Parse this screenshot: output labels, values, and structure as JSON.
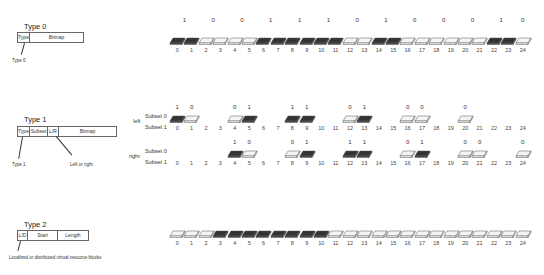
{
  "type0": {
    "title": "Type 0",
    "fields": [
      {
        "label": "Type",
        "w": 11
      },
      {
        "label": "Bitmap",
        "w": 53
      }
    ],
    "pointer_note": "Type 0",
    "bits": [
      "1",
      "0",
      "0",
      "1",
      "1",
      "1",
      "0",
      "1",
      "0",
      "0",
      "0",
      "1",
      "0"
    ],
    "dark_blocks": [
      0,
      1,
      6,
      7,
      8,
      9,
      10,
      11,
      14,
      15,
      22,
      23
    ],
    "indices": [
      "0",
      "1",
      "2",
      "3",
      "4",
      "5",
      "6",
      "7",
      "8",
      "9",
      "10",
      "11",
      "12",
      "13",
      "14",
      "15",
      "16",
      "17",
      "18",
      "19",
      "20",
      "21",
      "22",
      "23",
      "24"
    ]
  },
  "type1": {
    "title": "Type 1",
    "fields": [
      {
        "label": "Type",
        "w": 11
      },
      {
        "label": "Subset",
        "w": 17
      },
      {
        "label": "L/R",
        "w": 10
      },
      {
        "label": "Bitmap",
        "w": 57
      }
    ],
    "pointer_note_type": "Type 1",
    "pointer_note_lr": "Left or right",
    "left": {
      "label": "left",
      "subset0": "Subset 0",
      "subset1": "Subset 1",
      "groups": [
        {
          "start": 0,
          "bits": [
            "1",
            "0"
          ],
          "dark": [
            0
          ]
        },
        {
          "start": 4,
          "bits": [
            "0",
            "1"
          ],
          "dark": [
            5
          ]
        },
        {
          "start": 8,
          "bits": [
            "1",
            "1"
          ],
          "dark": [
            8,
            9
          ]
        },
        {
          "start": 12,
          "bits": [
            "0",
            "1"
          ],
          "dark": [
            13
          ]
        },
        {
          "start": 16,
          "bits": [
            "0",
            "0"
          ],
          "dark": []
        },
        {
          "start": 20,
          "bits": [
            "0"
          ],
          "dark": []
        }
      ]
    },
    "right": {
      "label": "right",
      "subset0": "Subset 0",
      "subset1": "Subset 1",
      "groups": [
        {
          "start": 4,
          "bits": [
            "1",
            "0"
          ],
          "dark": [
            4
          ]
        },
        {
          "start": 8,
          "bits": [
            "0",
            "1"
          ],
          "dark": [
            9
          ]
        },
        {
          "start": 12,
          "bits": [
            "1",
            "1"
          ],
          "dark": [
            12,
            13
          ]
        },
        {
          "start": 16,
          "bits": [
            "0",
            "1"
          ],
          "dark": [
            17
          ]
        },
        {
          "start": 20,
          "bits": [
            "0",
            "0"
          ],
          "dark": []
        },
        {
          "start": 24,
          "bits": [
            "0"
          ],
          "dark": []
        }
      ]
    },
    "indices": [
      "0",
      "1",
      "2",
      "3",
      "4",
      "5",
      "6",
      "7",
      "8",
      "9",
      "10",
      "11",
      "12",
      "13",
      "14",
      "15",
      "16",
      "17",
      "18",
      "19",
      "20",
      "21",
      "22",
      "23",
      "24"
    ]
  },
  "type2": {
    "title": "Type 2",
    "fields": [
      {
        "label": "L/D",
        "w": 9
      },
      {
        "label": "Start",
        "w": 29
      },
      {
        "label": "Length",
        "w": 30
      }
    ],
    "pointer_note": "Localized or distributed virtual resource blocks",
    "dark_blocks": [
      3,
      4,
      5,
      6,
      7,
      8,
      9,
      10
    ],
    "indices": [
      "0",
      "1",
      "2",
      "3",
      "4",
      "5",
      "6",
      "7",
      "8",
      "9",
      "10",
      "11",
      "12",
      "13",
      "14",
      "15",
      "16",
      "17",
      "18",
      "19",
      "20",
      "21",
      "22",
      "23",
      "24"
    ]
  },
  "colors": {
    "dark_block": "#4a4a4a",
    "dark_top": "#333333",
    "light_block": "#ffffff",
    "outline": "#555555"
  }
}
